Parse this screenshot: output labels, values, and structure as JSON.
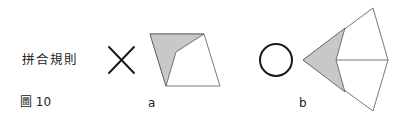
{
  "diagram": {
    "title": "拼合規則",
    "figure_label": "圖 10",
    "subfigures": [
      {
        "id": "a",
        "label": "a",
        "mark": "cross",
        "mark_meaning": "incorrect",
        "shape": "quadrilateral with shaded triangular region along left edge"
      },
      {
        "id": "b",
        "label": "b",
        "mark": "circle",
        "mark_meaning": "correct",
        "shape": "kite split into regions with shaded concave region on left"
      }
    ],
    "colors": {
      "stroke": "#1a1a1a",
      "thin_stroke": "#555555",
      "shade": "#c8c8c8",
      "background": "#ffffff"
    }
  }
}
